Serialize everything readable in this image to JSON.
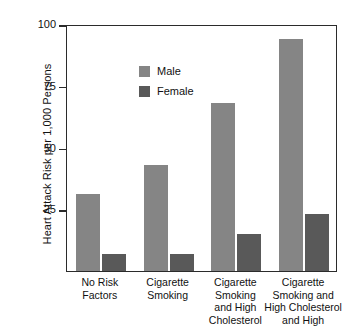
{
  "chart_data": {
    "type": "bar",
    "title": "",
    "xlabel": "",
    "ylabel": "Heart Attack Risk per 1,000 Persons",
    "ylim": [
      0,
      100
    ],
    "yticks": [
      25,
      50,
      75,
      100
    ],
    "grid": false,
    "legend_position": "top-left",
    "categories": [
      "No Risk\nFactors",
      "Cigarette\nSmoking",
      "Cigarette\nSmoking\nand High\nCholesterol",
      "Cigarette\nSmoking and\nHigh Cholesterol\nand High"
    ],
    "series": [
      {
        "name": "Male",
        "color": "#858585",
        "values": [
          31,
          43,
          68,
          94
        ]
      },
      {
        "name": "Female",
        "color": "#595959",
        "values": [
          7,
          7,
          15,
          23
        ]
      }
    ]
  },
  "axis": {
    "y_title": "Heart Attack Risk per 1,000 Persons",
    "y_tick_labels": [
      "100",
      "75",
      "50",
      "25"
    ]
  },
  "legend": {
    "items": [
      {
        "label": "Male"
      },
      {
        "label": "Female"
      }
    ]
  },
  "x_axis": {
    "labels": [
      {
        "lines": [
          "No Risk",
          "Factors"
        ]
      },
      {
        "lines": [
          "Cigarette",
          "Smoking"
        ]
      },
      {
        "lines": [
          "Cigarette",
          "Smoking",
          "and High",
          "Cholesterol"
        ]
      },
      {
        "lines": [
          "Cigarette",
          "Smoking and",
          "High Cholesterol",
          "and High"
        ]
      }
    ]
  },
  "colors": {
    "male": "#858585",
    "female": "#595959",
    "frame": "#2b2b2b",
    "background": "#ffffff"
  }
}
